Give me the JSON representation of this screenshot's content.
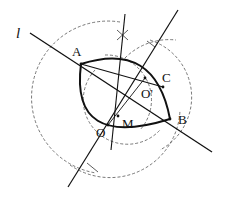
{
  "figure": {
    "type": "geometric-construction",
    "labels": {
      "line_l": "l",
      "A": "A",
      "B": "B",
      "C": "C",
      "O_prime": "O'",
      "O": "O",
      "M": "M"
    },
    "colors": {
      "stroke": "#111111",
      "dashed": "#444444",
      "background": "#ffffff"
    }
  }
}
